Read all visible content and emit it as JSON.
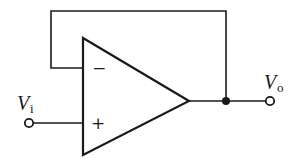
{
  "diagram": {
    "type": "circuit",
    "components": [
      {
        "id": "opamp",
        "kind": "operational-amplifier"
      },
      {
        "id": "input_terminal",
        "kind": "terminal"
      },
      {
        "id": "output_terminal",
        "kind": "terminal"
      },
      {
        "id": "junction",
        "kind": "node"
      }
    ],
    "opamp": {
      "inverting_sign": "−",
      "noninverting_sign": "+"
    },
    "input": {
      "symbol": "V",
      "subscript": "i"
    },
    "output": {
      "symbol": "V",
      "subscript": "o"
    },
    "connections": [
      "V_i terminal → non-inverting (+) input",
      "op-amp output → junction → V_o terminal",
      "junction → feedback loop → inverting (−) input"
    ],
    "colors": {
      "stroke": "#1a1a1a",
      "background": "#ffffff"
    }
  }
}
